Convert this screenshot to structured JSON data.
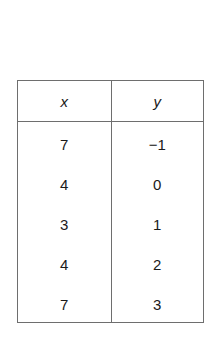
{
  "table": {
    "columns": [
      "x",
      "y"
    ],
    "rows": [
      {
        "x": "7",
        "y": "−1"
      },
      {
        "x": "4",
        "y": "0"
      },
      {
        "x": "3",
        "y": "1"
      },
      {
        "x": "4",
        "y": "2"
      },
      {
        "x": "7",
        "y": "3"
      }
    ]
  }
}
